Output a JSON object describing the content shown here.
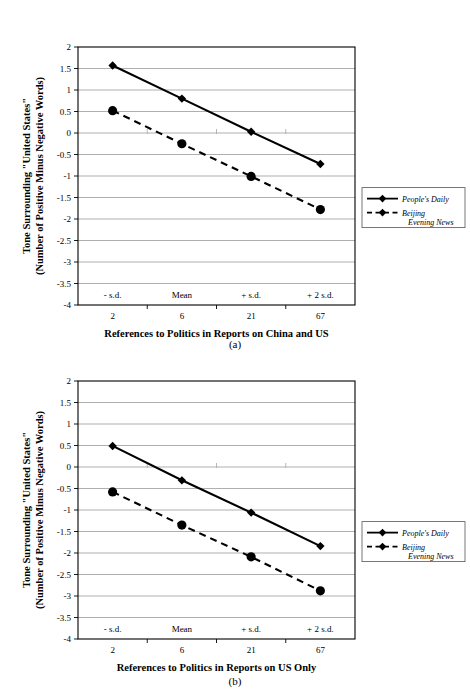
{
  "figure": {
    "panels": [
      {
        "caption": "(a)",
        "xlabel": "References to Politics in Reports on China and US",
        "ylabel_line1": "Tone Surrounding \"United States\"",
        "ylabel_line2": "(Number of Positive Minus Negative Words)"
      },
      {
        "caption": "(b)",
        "xlabel": "References to Politics in Reports on US Only",
        "ylabel_line1": "Tone Surrounding \"United States\"",
        "ylabel_line2": "(Number of Positive Minus Negative Words)"
      }
    ],
    "legend": {
      "entries": [
        {
          "label": "People's Daily",
          "style": "solid",
          "marker": "diamond",
          "color": "#000000"
        },
        {
          "label": "Beijing",
          "label2": "Evening News",
          "style": "dashed",
          "marker": "circle",
          "color": "#000000"
        }
      ]
    },
    "colors": {
      "line": "#000000",
      "grid": "#a6a6a6",
      "frame": "#000000",
      "background": "#ffffff"
    }
  },
  "chart_data": [
    {
      "type": "line",
      "title": "(a)",
      "xlabel": "References to Politics in Reports on China and US",
      "ylabel": "Tone Surrounding \"United States\" (Number of Positive Minus Negative Words)",
      "categories": [
        "- s.d.",
        "Mean",
        "+ s.d.",
        "+ 2 s.d."
      ],
      "x_secondary_ticks": [
        "2",
        "6",
        "21",
        "67"
      ],
      "ylim": [
        -4,
        2
      ],
      "ytick_labels": [
        "2",
        "1.5",
        "1",
        "0.5",
        "0",
        "-0.5",
        "-1",
        "-1.5",
        "-2",
        "-2.5",
        "-3",
        "-3.5",
        "-4"
      ],
      "ytick_values": [
        2,
        1.5,
        1,
        0.5,
        0,
        -0.5,
        -1,
        -1.5,
        -2,
        -2.5,
        -3,
        -3.5,
        -4
      ],
      "grid": true,
      "legend_position": "right",
      "series": [
        {
          "name": "People's Daily",
          "marker": "diamond",
          "style": "solid",
          "values": [
            1.57,
            0.8,
            0.03,
            -0.72
          ]
        },
        {
          "name": "Beijing Evening News",
          "marker": "circle",
          "style": "dashed",
          "values": [
            0.52,
            -0.25,
            -1.01,
            -1.78
          ]
        }
      ]
    },
    {
      "type": "line",
      "title": "(b)",
      "xlabel": "References to Politics in Reports on US Only",
      "ylabel": "Tone Surrounding \"United States\" (Number of Positive Minus Negative Words)",
      "categories": [
        "- s.d.",
        "Mean",
        "+ s.d.",
        "+ 2 s.d."
      ],
      "x_secondary_ticks": [
        "2",
        "6",
        "21",
        "67"
      ],
      "ylim": [
        -4,
        2
      ],
      "ytick_labels": [
        "2",
        "1.5",
        "1",
        "0.5",
        "0",
        "-0.5",
        "-1",
        "-1.5",
        "-2",
        "-2.5",
        "-3",
        "-3.5",
        "-4"
      ],
      "ytick_values": [
        2,
        1.5,
        1,
        0.5,
        0,
        -0.5,
        -1,
        -1.5,
        -2,
        -2.5,
        -3,
        -3.5,
        -4
      ],
      "grid": true,
      "legend_position": "right",
      "series": [
        {
          "name": "People's Daily",
          "marker": "diamond",
          "style": "solid",
          "values": [
            0.49,
            -0.31,
            -1.06,
            -1.84
          ]
        },
        {
          "name": "Beijing Evening News",
          "marker": "circle",
          "style": "dashed",
          "values": [
            -0.58,
            -1.35,
            -2.09,
            -2.88
          ]
        }
      ]
    }
  ]
}
